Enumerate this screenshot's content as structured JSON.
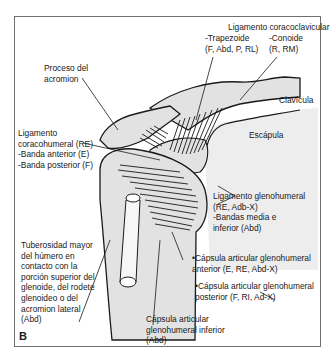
{
  "figure": {
    "panel_label": "B",
    "labels": {
      "coracoclavicular": {
        "title": "Ligamento coracoclavicular",
        "trapezoid": "-Trapezoide",
        "trapezoid_tests": "(F, Abd, P, RL)",
        "conoid": "-Conoide",
        "conoid_tests": "(R, RM)"
      },
      "acromion": {
        "line1": "Proceso del",
        "line2": "acromion"
      },
      "clavicle": "Clavícula",
      "scapula": "Escápula",
      "coracohumeral": {
        "line1": "Ligamento",
        "line2": "coracohumeral (RE)",
        "line3": "-Banda anterior (E)",
        "line4": "-Banda posterior (F)"
      },
      "glenohumeral": {
        "line1": "Ligamento glenohumeral",
        "line2": "(RE, Adb-X)",
        "line3": "-Bandas media e",
        "line4": "inferior (Abd)"
      },
      "tuberosity": {
        "line1": "Tuberosidad mayor",
        "line2": "del húmero en",
        "line3": "contacto con la",
        "line4": "porción superior del",
        "line5": "glenoide, del rodete",
        "line6": "glenoideo o del",
        "line7": "acromion lateral",
        "line8": "(Abd)"
      },
      "anterior_capsule": {
        "line1": "•Cápsula articular glenohumeral",
        "line2": "anterior (E, RE, Abd-X)"
      },
      "posterior_capsule": {
        "line1": "•Cápsula articular glenohumeral",
        "line2": "posterior (F, RI, Ad-X)"
      },
      "inferior_capsule": {
        "line1": "Cápsula articular",
        "line2": "glenohumeral inferior",
        "line3": "(Abd)"
      }
    },
    "colors": {
      "bone_fill": "#e2e2e2",
      "outline": "#1a1a1a",
      "frame": "#6e6e6e"
    }
  }
}
